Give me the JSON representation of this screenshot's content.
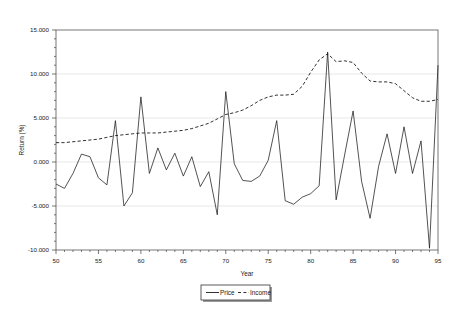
{
  "chart_data": {
    "type": "line",
    "title": "",
    "xlabel": "Year",
    "ylabel": "Return (%)",
    "xlim": [
      50,
      95
    ],
    "ylim": [
      -10,
      15
    ],
    "grid": true,
    "legend_position": "bottom-center",
    "x_ticks": [
      "50",
      "55",
      "60",
      "65",
      "70",
      "75",
      "80",
      "85",
      "90",
      "95"
    ],
    "x_tick_values": [
      50,
      55,
      60,
      65,
      70,
      75,
      80,
      85,
      90,
      95
    ],
    "y_ticks": [
      "15.000",
      "10.000",
      "5.000",
      "0.000",
      "-5.000",
      "-10.000"
    ],
    "y_tick_values": [
      15,
      10,
      5,
      0,
      -5,
      -10
    ],
    "x": [
      50,
      51,
      52,
      53,
      54,
      55,
      56,
      57,
      58,
      59,
      60,
      61,
      62,
      63,
      64,
      65,
      66,
      67,
      68,
      69,
      70,
      71,
      72,
      73,
      74,
      75,
      76,
      77,
      78,
      79,
      80,
      81,
      82,
      83,
      84,
      85,
      86,
      87,
      88,
      89,
      90,
      91,
      92,
      93,
      94,
      95
    ],
    "series": [
      {
        "name": "Price",
        "style": "solid",
        "color": "#1a1a1a",
        "values": [
          -2.5,
          -3.0,
          -1.3,
          0.9,
          0.6,
          -1.8,
          -2.6,
          4.7,
          -5.0,
          -3.5,
          7.4,
          -1.3,
          1.6,
          -0.9,
          1.0,
          -1.6,
          0.6,
          -2.8,
          -1.1,
          -6.0,
          8.0,
          -0.2,
          -2.1,
          -2.2,
          -1.6,
          0.2,
          4.7,
          -4.4,
          -4.8,
          -4.0,
          -3.6,
          -2.7,
          12.5,
          -4.3,
          0.8,
          5.8,
          -2.2,
          -6.4,
          -0.5,
          3.2,
          -1.3,
          4.0,
          -1.3,
          2.4,
          -9.8,
          11.0
        ]
      },
      {
        "name": "Income",
        "style": "dashed",
        "color": "#1a1a1a",
        "values": [
          2.2,
          2.2,
          2.3,
          2.4,
          2.5,
          2.6,
          2.8,
          3.0,
          3.1,
          3.2,
          3.3,
          3.3,
          3.3,
          3.4,
          3.5,
          3.6,
          3.8,
          4.1,
          4.4,
          4.9,
          5.4,
          5.6,
          5.9,
          6.4,
          7.0,
          7.4,
          7.6,
          7.6,
          7.7,
          8.6,
          10.2,
          11.6,
          12.3,
          11.4,
          11.5,
          11.3,
          10.1,
          9.2,
          9.1,
          9.1,
          8.9,
          8.1,
          7.3,
          6.9,
          6.9,
          7.1
        ]
      }
    ],
    "legend_entries": [
      {
        "label": "Price",
        "style": "solid"
      },
      {
        "label": "Income",
        "style": "dashed"
      }
    ],
    "annotations": []
  }
}
